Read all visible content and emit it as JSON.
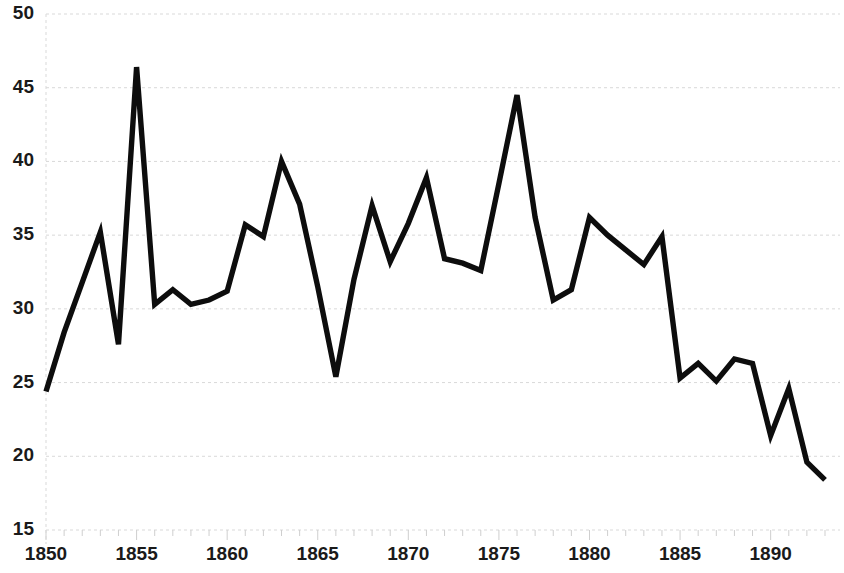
{
  "chart_data": {
    "type": "line",
    "title": "",
    "subtitle": "",
    "xlabel": "",
    "ylabel": "",
    "xlim": [
      1850,
      1893
    ],
    "ylim": [
      15,
      50
    ],
    "grid": true,
    "legend": null,
    "y_ticks": [
      15,
      20,
      25,
      30,
      35,
      40,
      45,
      50
    ],
    "y_tick_labels": [
      "15",
      "20",
      "25",
      "30",
      "35",
      "40",
      "45",
      "50"
    ],
    "x_ticks": [
      1850,
      1855,
      1860,
      1865,
      1870,
      1875,
      1880,
      1885,
      1890
    ],
    "x_tick_labels": [
      "1850",
      "1855",
      "1860",
      "1865",
      "1870",
      "1875",
      "1880",
      "1885",
      "1890"
    ],
    "x_minor_tick_step": 1,
    "line_color": "#0d0d0d",
    "grid_color": "#d9d9d9",
    "background_color": "#ffffff",
    "x": [
      1850,
      1851,
      1852,
      1853,
      1854,
      1855,
      1856,
      1857,
      1858,
      1859,
      1860,
      1861,
      1862,
      1863,
      1864,
      1865,
      1866,
      1867,
      1868,
      1869,
      1870,
      1871,
      1872,
      1873,
      1874,
      1875,
      1876,
      1877,
      1878,
      1879,
      1880,
      1881,
      1882,
      1883,
      1884,
      1885,
      1886,
      1887,
      1888,
      1889,
      1890,
      1891,
      1892,
      1893
    ],
    "values": [
      24.4,
      28.4,
      31.8,
      35.2,
      27.6,
      46.4,
      30.3,
      31.3,
      30.3,
      30.6,
      31.2,
      35.7,
      34.9,
      40.0,
      37.1,
      31.5,
      25.4,
      32.0,
      37.0,
      33.2,
      35.8,
      38.9,
      33.4,
      33.1,
      32.6,
      38.5,
      44.5,
      36.2,
      30.6,
      31.3,
      36.2,
      35.0,
      34.0,
      33.0,
      34.9,
      25.3,
      26.3,
      25.1,
      26.6,
      26.3,
      21.4,
      24.6,
      19.6,
      18.4
    ],
    "series": [
      {
        "name": "series-1",
        "values": [
          24.4,
          28.4,
          31.8,
          35.2,
          27.6,
          46.4,
          30.3,
          31.3,
          30.3,
          30.6,
          31.2,
          35.7,
          34.9,
          40.0,
          37.1,
          31.5,
          25.4,
          32.0,
          37.0,
          33.2,
          35.8,
          38.9,
          33.4,
          33.1,
          32.6,
          38.5,
          44.5,
          36.2,
          30.6,
          31.3,
          36.2,
          35.0,
          34.0,
          33.0,
          34.9,
          25.3,
          26.3,
          25.1,
          26.6,
          26.3,
          21.4,
          24.6,
          19.6,
          18.4
        ]
      }
    ]
  }
}
